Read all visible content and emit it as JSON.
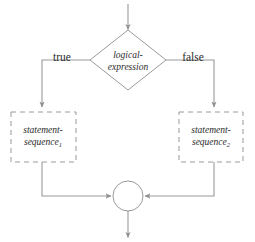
{
  "diagram": {
    "type": "if-else-control-flow",
    "colors": {
      "background": "#ffffff",
      "line": "#9a9a9a",
      "arrow": "#8f8f8f",
      "text": "#2b2b2b"
    },
    "entry_arrow": {
      "name": "entry-arrow",
      "from_y": 4,
      "to_y": 30,
      "x": 128
    },
    "decision": {
      "label_line1": "logical-",
      "label_line2": "expression",
      "center_x": 128,
      "center_y": 60,
      "half_width": 38,
      "half_height": 30
    },
    "branches": [
      {
        "label": "true",
        "side": "left",
        "x": 42
      },
      {
        "label": "false",
        "side": "right",
        "x": 214
      }
    ],
    "statements": [
      {
        "name": "statement-sequence-1",
        "label_line1": "statement-",
        "label_line2": "sequence",
        "subscript": "1",
        "x": 11,
        "y": 112,
        "width": 65,
        "height": 50
      },
      {
        "name": "statement-sequence-2",
        "label_line1": "statement-",
        "label_line2": "sequence",
        "subscript": "2",
        "x": 179,
        "y": 112,
        "width": 64,
        "height": 50
      }
    ],
    "merge": {
      "name": "merge-node",
      "center_x": 128,
      "center_y": 196,
      "radius": 15
    },
    "exit_arrow": {
      "name": "exit-arrow",
      "from_y": 211,
      "to_y": 238,
      "x": 128
    }
  }
}
